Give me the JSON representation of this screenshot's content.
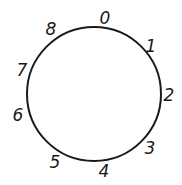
{
  "diagram": {
    "circle": {
      "cx": 94,
      "cy": 94,
      "r": 67,
      "stroke": "#1a1a1a",
      "stroke_width": 2
    },
    "labels": [
      {
        "text": "0",
        "x": 105,
        "y": 18
      },
      {
        "text": "1",
        "x": 151,
        "y": 46
      },
      {
        "text": "2",
        "x": 169,
        "y": 95
      },
      {
        "text": "3",
        "x": 150,
        "y": 148
      },
      {
        "text": "4",
        "x": 104,
        "y": 171
      },
      {
        "text": "5",
        "x": 55,
        "y": 162
      },
      {
        "text": "6",
        "x": 18,
        "y": 115
      },
      {
        "text": "7",
        "x": 22,
        "y": 70
      },
      {
        "text": "8",
        "x": 51,
        "y": 29
      }
    ]
  }
}
